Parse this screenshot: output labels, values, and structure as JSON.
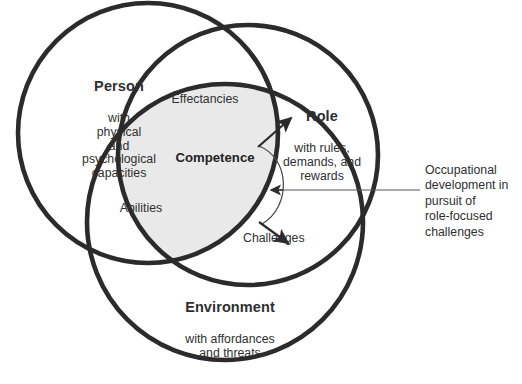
{
  "figure": {
    "type": "venn-diagram",
    "set_count": 3,
    "background": "#ffffff",
    "stroke_color": "#2b2b2b",
    "center_fill": "#e9e9e9"
  },
  "circles": {
    "person": {
      "heading": "Person",
      "subtext": "with\nphysical\nand\npsychological\ncapacities"
    },
    "role": {
      "heading": "Role",
      "subtext": "with rules,\ndemands, and\nrewards"
    },
    "environment": {
      "heading": "Environment",
      "subtext": "with affordances\nand threats"
    }
  },
  "overlaps": {
    "person_role": "Effectancies",
    "person_environment": "Abilities",
    "role_environment": "Challenges",
    "center": "Competence"
  },
  "annotation": {
    "text": "Occupational\ndevelopment in\npursuit of\nrole-focused\nchallenges"
  }
}
